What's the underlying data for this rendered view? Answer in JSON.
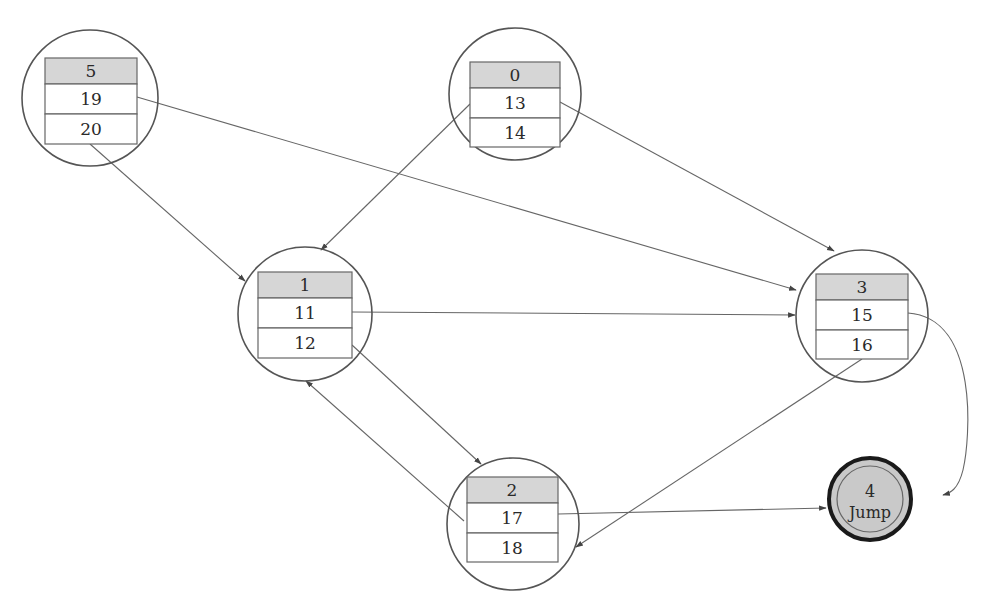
{
  "diagram": {
    "type": "state-transition-graph",
    "colors": {
      "line": "#555555",
      "header_fill": "#d6d6d6",
      "cell_fill": "#ffffff",
      "final_fill": "#c9c9c9",
      "final_ring": "#1a1a1a"
    },
    "nodes": [
      {
        "id": "5",
        "header": "5",
        "rows": [
          "19",
          "20"
        ]
      },
      {
        "id": "0",
        "header": "0",
        "rows": [
          "13",
          "14"
        ]
      },
      {
        "id": "1",
        "header": "1",
        "rows": [
          "11",
          "12"
        ]
      },
      {
        "id": "3",
        "header": "3",
        "rows": [
          "15",
          "16"
        ]
      },
      {
        "id": "2",
        "header": "2",
        "rows": [
          "17",
          "18"
        ]
      }
    ],
    "final_node": {
      "id": "4",
      "number": "4",
      "label": "Jump"
    },
    "edges": [
      {
        "from": "5.20",
        "to": "1"
      },
      {
        "from": "5.19",
        "to": "3"
      },
      {
        "from": "0.13",
        "to": "1"
      },
      {
        "from": "0.13",
        "to": "3"
      },
      {
        "from": "1.11",
        "to": "3"
      },
      {
        "from": "1.12",
        "to": "2"
      },
      {
        "from": "2.18",
        "to": "1"
      },
      {
        "from": "2.17",
        "to": "4"
      },
      {
        "from": "3.15",
        "to": "4"
      },
      {
        "from": "3.16",
        "to": "2"
      }
    ]
  }
}
